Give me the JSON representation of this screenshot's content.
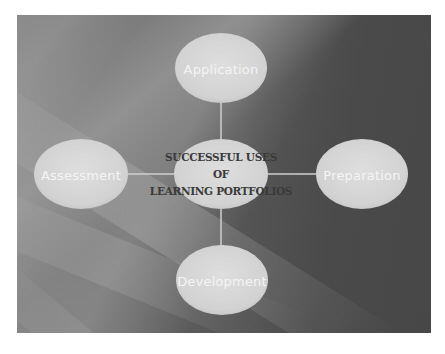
{
  "diagram": {
    "type": "hub-and-spoke",
    "center": {
      "title_lines": [
        "SUCCESSFUL USES",
        "OF",
        "LEARNING PORTFOLIOS"
      ]
    },
    "nodes": [
      {
        "id": "top",
        "label": "Application"
      },
      {
        "id": "left",
        "label": "Assessment"
      },
      {
        "id": "right",
        "label": "Preparation"
      },
      {
        "id": "bottom",
        "label": "Development"
      }
    ],
    "colors": {
      "ellipse_fill": "#d4d4d4",
      "connector": "#cfcfcf",
      "node_text": "#f4f4f4",
      "center_text": "#3a3a3a",
      "background_dark": "#474747",
      "background_light": "#8a8a8a"
    }
  }
}
